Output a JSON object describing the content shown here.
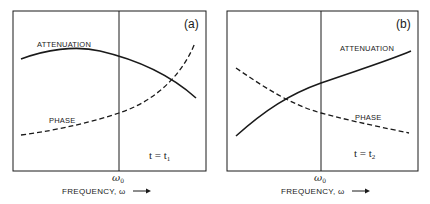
{
  "panels": [
    {
      "tag": "(a)",
      "attenuation_label": "ATTENUATION",
      "phase_label": "PHASE",
      "time_label": "t = t",
      "time_sub": "1",
      "omega0_label": "ω",
      "omega0_sub": "0",
      "xlabel": "FREQUENCY, ω",
      "arrow": "⟶"
    },
    {
      "tag": "(b)",
      "attenuation_label": "ATTENUATION",
      "phase_label": "PHASE",
      "time_label": "t = t",
      "time_sub": "2",
      "omega0_label": "ω",
      "omega0_sub": "0",
      "xlabel": "FREQUENCY, ω",
      "arrow": "⟶"
    }
  ],
  "colors": {
    "line": "#1a1a1a",
    "background": "#ffffff"
  }
}
